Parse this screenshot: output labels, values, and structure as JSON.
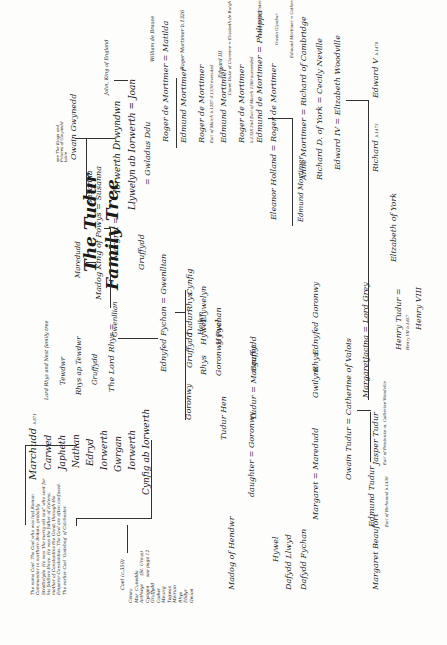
{
  "title": {
    "line1": "The Tudur",
    "line2": "Family Tree"
  },
  "left_note": "The name Coel. The Coel who was last Roman Commander in northern Britain, probably Strathclyde. He was 'the merry old soul' who sent for his fiddlers three. He was the father of Helena, mother of Constantine the Great, through the Emperor Constantius. The Coel are often confused. The earlier Coel 'Godebog' of Colchester.",
  "coel_line": {
    "head": "Coel (c.350)",
    "names": [
      "Ceneu",
      "Mor",
      "Arthwys",
      "Cyngen",
      "Gruffydd",
      "Cadwr",
      "Meurig",
      "Tegwas",
      "Meirion",
      "Rhys",
      "Elidyr",
      "Gwion"
    ],
    "side1": "Cunedda",
    "side2": "(St. Ursus)",
    "side3": "see page 12"
  },
  "marchudd_line": {
    "head": "Marchudd",
    "head_date": "b.871",
    "names": [
      "Carwed",
      "Japheth",
      "Nathan",
      "Edryd",
      "Iorwerth",
      "Gwrgan",
      "Iorwerth",
      "Cynfig ab Iorwerth"
    ]
  },
  "rhys_line": {
    "caption": "Lord Rhys and Nest family tree",
    "names": [
      "Tewdwr",
      "Rhys ap Tewdwr",
      "Gruffydd",
      "The Lord Rhys"
    ]
  },
  "powys": {
    "marchudd": "Maredudd",
    "madog": "Madog King of Powys",
    "susanna": "Susanna",
    "gwenllian": "Gwenllian",
    "margret": "Margret"
  },
  "gwynedd": {
    "caption": "see The Kings and Princes of Gwynedd table",
    "owain": "Owain Gwynedd",
    "iorwerth": "Iorwerth Drwyndwn",
    "llywelyn": "Llywelyn ab Iorwerth",
    "joan": "Joan",
    "john": "John, King of England",
    "gwladus": "Gwladus Ddu",
    "ralph": "Ralph de Mortimer",
    "william": "William de Braose",
    "matilda": "Matilda"
  },
  "mortimer": [
    {
      "name": "Roger de Mortimer",
      "note": "b.1231 d.1282"
    },
    {
      "name": "Edmund Mortimer",
      "note": "b.1261"
    },
    {
      "name": "Roger de Mortimer",
      "note": "Earl of March b.1287 d.1330 executed"
    },
    {
      "name": "Edmund Mortimer",
      "note": "b.1310"
    },
    {
      "name": "Roger de Mortimer",
      "note": "b.1328 2nd Earl of March 1360 succeeded"
    },
    {
      "name": "Edmund de Mortimer",
      "note": "3rd Earl of March"
    },
    {
      "name": "Roger de Mortimer",
      "note": "4th Earl of March b.1374"
    }
  ],
  "mortimer_side": {
    "roger": "Roger Mortimer b.1326",
    "edward3": "Edward III",
    "lionel": "Lionel Duke of Clarence",
    "elizabeth": "Elizabeth de Burgh",
    "philippa": "Philippa",
    "philippa_note": "Countess of Ulster",
    "owain_glyndwr": "Owain Glyndwr",
    "edmund_catherine": "Edmund Mortimer = Catherine"
  },
  "york": {
    "eleanor": "Eleanor Holland",
    "edmund": "Edmund Mortimer",
    "edmund_date": "b.1391",
    "anne": "Anne Mortimer",
    "richard_c": "Richard of Cambridge",
    "richard_y": "Richard D. of York",
    "cecily": "Cecily Neville",
    "edward4": "Edward IV",
    "edward4_date": "b.1442",
    "elizabeth_w": "Elizabeth Woodville",
    "richard": "Richard",
    "richard_date": "b.1473",
    "edward5": "Edward V",
    "edward5_date": "b.1470",
    "elizabeth_y": "Elizabeth of York"
  },
  "middle": {
    "ednyfed": "Ednyfed Fychan",
    "ednyfed_date": "d.1246",
    "gwenllian2": "Gwenllian",
    "gruffydd_a": "Gruffydd",
    "goronwy": "Goronwy",
    "goronwy_date": "d.1268",
    "gruffydd_b": "Gruffydd",
    "tudur": "Tudur",
    "tudur_date": "d.1278",
    "rhys": "Rhys",
    "cynfig": "Cynfig",
    "hwlcyn": "Heilyn",
    "hwlcyn_date": "d.1296",
    "rhys2": "Rhys",
    "rhys2_date": "d.1324",
    "hywel": "Hywel",
    "hywel_date": "d.1341",
    "llywelyn2": "Llywelyn",
    "goronwy_f": "Goronwy Fychan",
    "hywel2": "Hywel",
    "tudur_hen": "Tudur Hen",
    "tudur_hen_date": "d.1311",
    "daughter": "daughter",
    "goronwy2": "Goronwy",
    "goronwy2_date": "d.1331",
    "tudur2": "Tudur",
    "tudur2_date": "d.1367",
    "margaret": "Margaret",
    "gruffydd3": "Gruffydd",
    "madog_h": "Madog of Hendwr",
    "hywel3": "Hywel",
    "hywel3_date": "d.1366",
    "dafydd_llwyd": "Dafydd Llwyd",
    "dafydd_f": "Dafydd Fychan",
    "margaret2": "Margaret",
    "maredudd": "Maredudd",
    "gwilym": "Gwilym",
    "rhys3": "Rhys",
    "rhys3_date": "d.1412",
    "ednyfed2": "Ednyfed",
    "goronwy3": "Goronwy",
    "goronwy3_date": "d.1382"
  },
  "tudor": {
    "owain": "Owain Tudur",
    "owain_date": "b.1400",
    "catherine": "Catherine of Valois",
    "margaret": "Margaret",
    "jacina": "Jacina",
    "lord_grey": "Lord Grey",
    "jasper": "Jasper Tudur",
    "jasper_note": "Earl of Pembroke m. Catherine Woodville",
    "edmund": "Edmund Tudur",
    "edmund_note": "Earl of Richmond b.1430",
    "margaret_b": "Margaret Beaufort",
    "henry": "Henry Tudur",
    "henry_note": "Henry VII b.1457",
    "henry8": "Henry VIII"
  },
  "symbols": {
    "married": "="
  }
}
